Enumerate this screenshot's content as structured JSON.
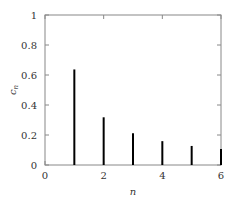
{
  "chart_data": {
    "type": "bar",
    "title": "",
    "xlabel": "n",
    "ylabel": "c_n",
    "x": [
      1,
      2,
      3,
      4,
      5,
      6
    ],
    "values": [
      0.637,
      0.318,
      0.212,
      0.159,
      0.127,
      0.106
    ],
    "xlim": [
      0,
      6
    ],
    "ylim": [
      0,
      1
    ],
    "xticks": [
      0,
      2,
      4,
      6
    ],
    "xtick_labels": [
      "0",
      "2",
      "4",
      "6"
    ],
    "yticks": [
      0,
      0.2,
      0.4,
      0.6,
      0.8,
      1
    ],
    "ytick_labels": [
      "0",
      "0.2",
      "0.4",
      "0.6",
      "0.8",
      "1"
    ],
    "grid": false,
    "bar_style": "stem lines",
    "bar_color": "#000000",
    "axis_color": "#888888"
  }
}
